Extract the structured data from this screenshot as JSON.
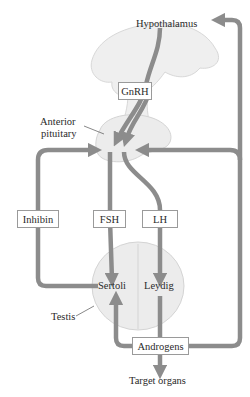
{
  "diagram": {
    "type": "hypothalamic-pituitary-testicular axis",
    "colors": {
      "arrow": "#8c8c8c",
      "tissue_fill": "#ececec",
      "tissue_stroke": "#d4d4d4",
      "box_border": "#9a9a9a",
      "text": "#2a2a2a"
    },
    "labels": {
      "hypothalamus": "Hypothalamus",
      "anterior_pituitary_line1": "Anterior",
      "anterior_pituitary_line2": "pituitary",
      "testis": "Testis",
      "sertoli": "Sertoli",
      "leydig": "Leydig",
      "target_organs": "Target organs"
    },
    "boxes": {
      "gnrh": "GnRH",
      "inhibin": "Inhibin",
      "fsh": "FSH",
      "lh": "LH",
      "androgens": "Androgens"
    },
    "edges": [
      {
        "from": "Hypothalamus",
        "to": "Anterior pituitary",
        "via": "GnRH"
      },
      {
        "from": "Anterior pituitary",
        "to": "Sertoli",
        "via": "FSH"
      },
      {
        "from": "Anterior pituitary",
        "to": "Leydig",
        "via": "LH"
      },
      {
        "from": "Sertoli",
        "to": "Anterior pituitary",
        "via": "Inhibin"
      },
      {
        "from": "Leydig",
        "to": "Androgens"
      },
      {
        "from": "Androgens",
        "to": "Sertoli"
      },
      {
        "from": "Androgens",
        "to": "Target organs"
      },
      {
        "from": "Androgens",
        "to": "Anterior pituitary"
      },
      {
        "from": "Androgens",
        "to": "Hypothalamus"
      }
    ]
  }
}
